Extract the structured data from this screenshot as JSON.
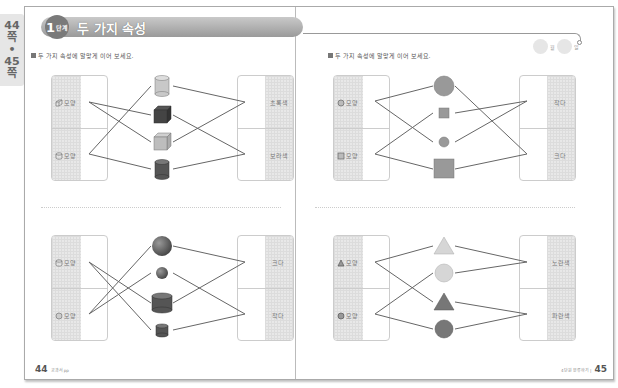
{
  "side_tab": {
    "page_from": "44",
    "unit_from": "쪽",
    "sep": "•",
    "page_to": "45",
    "unit_to": "쪽"
  },
  "header": {
    "badge_number": "1",
    "badge_suffix": "단계",
    "title": "두 가지 속성"
  },
  "date": {
    "month_label": "월",
    "day_label": "일"
  },
  "instruction": "두 가지 속성에 알맞게 이어 보세요.",
  "panels": [
    {
      "id": "p1",
      "left_box": [
        {
          "icon": "cube-icon",
          "label": "모양"
        },
        {
          "icon": "cylinder-icon",
          "label": "모양"
        }
      ],
      "right_box": [
        {
          "label": "초록색"
        },
        {
          "label": "보라색"
        }
      ],
      "items": [
        {
          "shape": "cylinder",
          "fill": "#c8c8c8"
        },
        {
          "shape": "cube",
          "fill": "#444444"
        },
        {
          "shape": "cube",
          "fill": "#bdbdbd"
        },
        {
          "shape": "cylinder",
          "fill": "#555555"
        }
      ]
    },
    {
      "id": "p2",
      "left_box": [
        {
          "icon": "cylinder-icon",
          "label": "모양"
        },
        {
          "icon": "sphere-icon",
          "label": "모양"
        }
      ],
      "right_box": [
        {
          "label": "크다"
        },
        {
          "label": "작다"
        }
      ],
      "items": [
        {
          "shape": "sphere-large",
          "fill": "#555555"
        },
        {
          "shape": "sphere-small",
          "fill": "#555555"
        },
        {
          "shape": "cylinder-large",
          "fill": "#555555"
        },
        {
          "shape": "cylinder-small",
          "fill": "#555555"
        }
      ]
    },
    {
      "id": "p3",
      "left_box": [
        {
          "icon": "circle-icon",
          "label": "모양"
        },
        {
          "icon": "square-icon",
          "label": "모양"
        }
      ],
      "right_box": [
        {
          "label": "작다"
        },
        {
          "label": "크다"
        }
      ],
      "items": [
        {
          "shape": "circle-large",
          "fill": "#999999"
        },
        {
          "shape": "square-small",
          "fill": "#999999"
        },
        {
          "shape": "circle-small",
          "fill": "#999999"
        },
        {
          "shape": "square-large",
          "fill": "#999999"
        }
      ]
    },
    {
      "id": "p4",
      "left_box": [
        {
          "icon": "triangle-icon",
          "label": "모양"
        },
        {
          "icon": "circle-icon",
          "label": "모양"
        }
      ],
      "right_box": [
        {
          "label": "노란색"
        },
        {
          "label": "파란색"
        }
      ],
      "items": [
        {
          "shape": "triangle",
          "fill": "#d6d6d6"
        },
        {
          "shape": "circle",
          "fill": "#d6d6d6"
        },
        {
          "shape": "triangle",
          "fill": "#777777"
        },
        {
          "shape": "circle",
          "fill": "#777777"
        }
      ]
    }
  ],
  "footer": {
    "left_page": "44",
    "left_caption": "교과서 pp",
    "right_page": "45",
    "right_caption": "4단원 분류하기 |"
  },
  "colors": {
    "line": "#666666",
    "shade": "#e8e8e8",
    "title_bar": "#a8a8a8"
  }
}
